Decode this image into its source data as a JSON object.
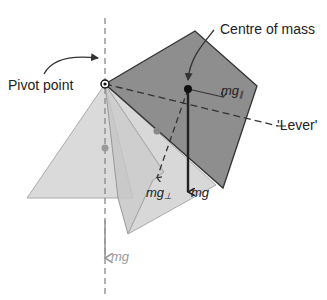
{
  "diagram": {
    "labels": {
      "pivot_point": "Pivot point",
      "centre_of_mass": "Centre of mass",
      "lever": "'Lever'",
      "mg_parallel": "mg",
      "mg_parallel_sub": "∥",
      "mg_perp": "mg",
      "mg_perp_sub": "⊥",
      "mg_dark": "mg",
      "mg_light": "mg"
    },
    "colors": {
      "dark_shape": "#8c8c8c",
      "mid_shape": "#bdbdbd",
      "light_shape": "#d6d6d6",
      "stroke": "#333333",
      "light_text": "#9a9a9a"
    },
    "shapes": [
      {
        "name": "rest-position-shape",
        "points": "105,84 28,198 133,198"
      },
      {
        "name": "intermediate-shape",
        "points": "105,84 165,175 129,235 109,100"
      },
      {
        "name": "tilted-shape",
        "points": "105,84 195,31 257,86 223,188"
      }
    ]
  }
}
